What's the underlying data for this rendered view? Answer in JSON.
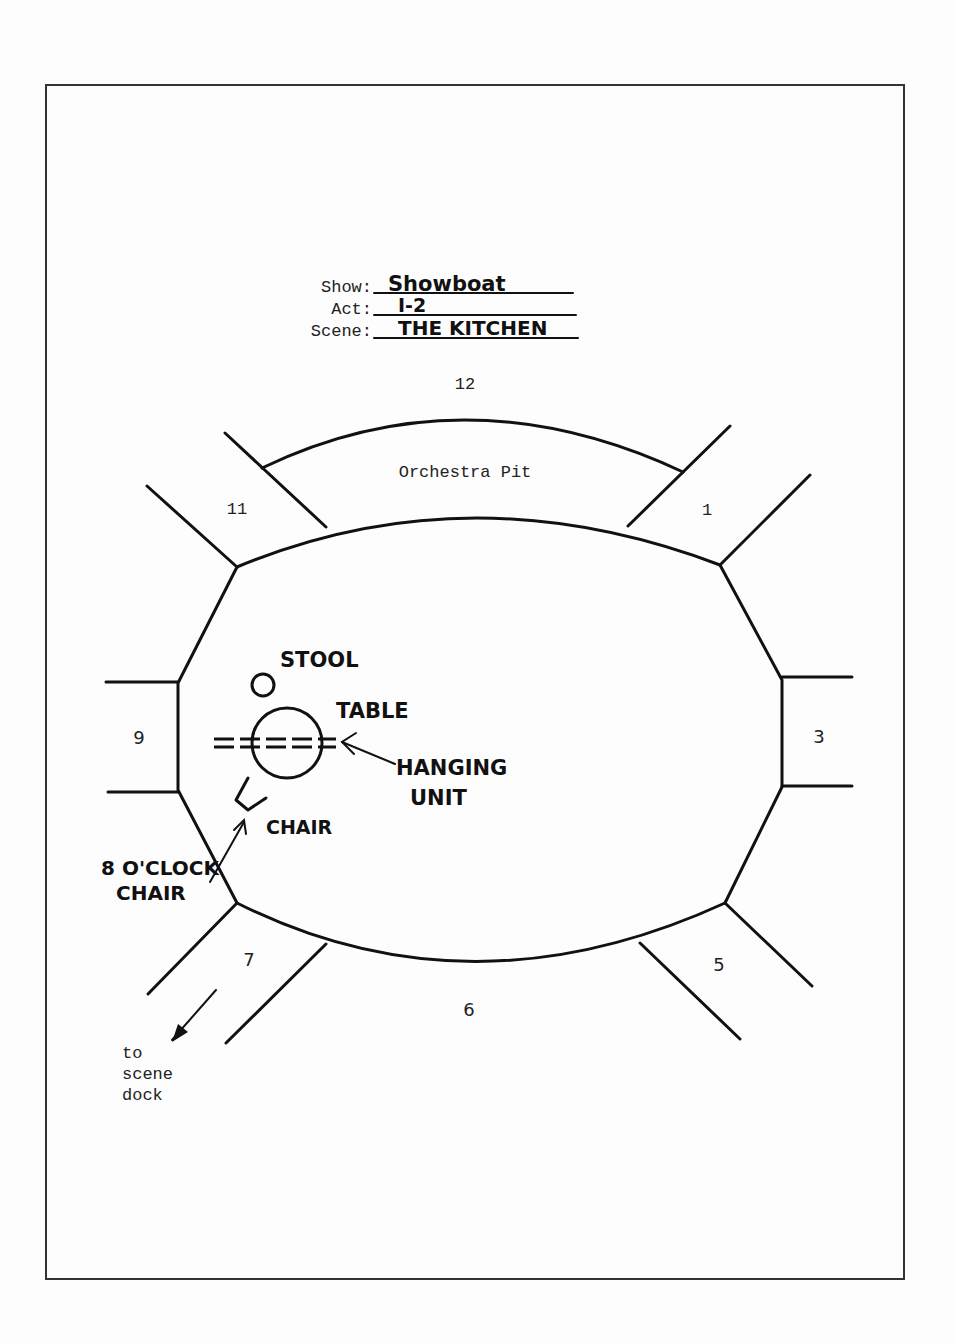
{
  "header": {
    "show_label": "Show:",
    "show_value": "Showboat",
    "act_label": "Act:",
    "act_value": "I-2",
    "scene_label": "Scene:",
    "scene_value": "THE KITCHEN"
  },
  "stage": {
    "orchestra_pit_label": "Orchestra Pit",
    "segments": {
      "s12": "12",
      "s1": "1",
      "s3": "3",
      "s5": "5",
      "s6": "6",
      "s7": "7",
      "s9": "9",
      "s11": "11"
    }
  },
  "props": {
    "stool": "STOOL",
    "table": "TABLE",
    "hanging_unit_line1": "HANGING",
    "hanging_unit_line2": "UNIT",
    "chair": "CHAIR",
    "eight_oclock_line1": "8 O'CLOCK",
    "eight_oclock_line2": "CHAIR"
  },
  "exit_note": {
    "line1": "to",
    "line2": "scene",
    "line3": "dock"
  }
}
